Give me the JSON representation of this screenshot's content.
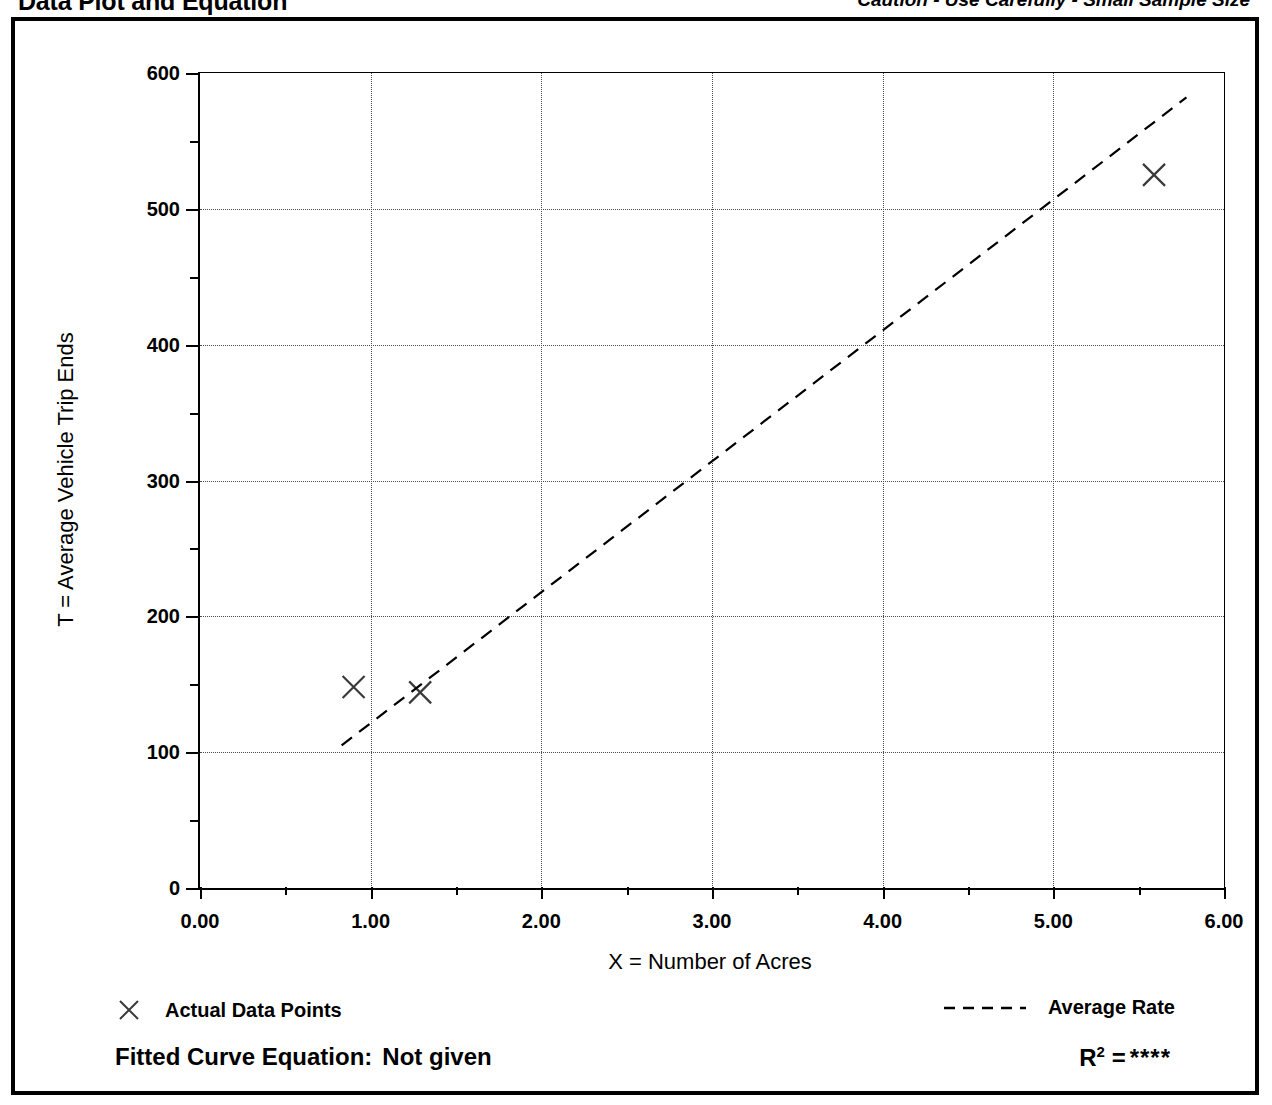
{
  "header": {
    "title": "Data Plot and Equation",
    "caution": "Caution - Use Carefully - Small Sample Size"
  },
  "legend": {
    "points_label": "Actual Data Points",
    "points_marker": "x-cross-marker",
    "rate_label": "Average Rate",
    "rate_marker": "dashed-line-sample"
  },
  "equation": {
    "fitted_label": "Fitted Curve Equation:",
    "fitted_value": "Not given",
    "r_label": "R",
    "r_exponent": "2",
    "r_equals": "=",
    "r_value": "****"
  },
  "colors": {
    "axis": "#000000",
    "grid": "#4a4a4a",
    "marker": "#3a3a3a",
    "trendline": "#000000",
    "background": "#ffffff"
  },
  "chart_data": {
    "type": "scatter",
    "title": "Data Plot and Equation",
    "xlabel": "X = Number of Acres",
    "ylabel": "T = Average Vehicle Trip Ends",
    "xlim": [
      0,
      6
    ],
    "ylim": [
      0,
      600
    ],
    "x_ticks": [
      0,
      1,
      2,
      3,
      4,
      5,
      6
    ],
    "x_tick_labels": [
      "0.00",
      "1.00",
      "2.00",
      "3.00",
      "4.00",
      "5.00",
      "6.00"
    ],
    "x_minor_ticks": [
      0.5,
      1.5,
      2.5,
      3.5,
      4.5,
      5.5
    ],
    "y_ticks": [
      0,
      100,
      200,
      300,
      400,
      500,
      600
    ],
    "y_tick_labels": [
      "0",
      "100",
      "200",
      "300",
      "400",
      "500",
      "600"
    ],
    "y_minor_ticks": [
      50,
      150,
      250,
      350,
      450,
      550
    ],
    "grid": true,
    "grid_style": "dotted",
    "legend_position": "below-plot",
    "series": [
      {
        "name": "Actual Data Points",
        "type": "scatter",
        "marker": "x",
        "points": [
          {
            "x": 0.9,
            "y": 148
          },
          {
            "x": 1.29,
            "y": 144
          },
          {
            "x": 5.59,
            "y": 525
          }
        ]
      },
      {
        "name": "Average Rate",
        "type": "line",
        "style": "dashed",
        "points": [
          {
            "x": 0.83,
            "y": 105
          },
          {
            "x": 5.78,
            "y": 582
          }
        ]
      }
    ]
  }
}
